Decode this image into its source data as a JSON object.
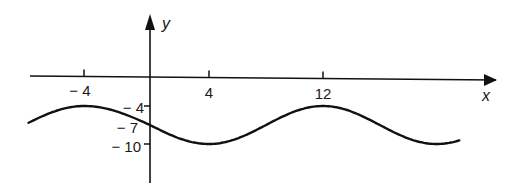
{
  "chart_data": {
    "type": "line",
    "title": "",
    "xlabel": "x",
    "ylabel": "y",
    "x_ticks": [
      -4,
      4,
      12
    ],
    "x_tick_labels": [
      "− 4",
      "4",
      "12"
    ],
    "y_ticks": [
      -4,
      -7,
      -10
    ],
    "y_tick_labels": [
      "− 4",
      "− 7",
      "− 10"
    ],
    "xlim": [
      -8,
      24
    ],
    "ylim": [
      -13,
      3
    ],
    "grid": false,
    "legend": null,
    "function": "y = -7 + 3cos(π(x - 12)/8)",
    "series": [
      {
        "name": "curve",
        "x": [
          -7.5,
          -6,
          -4,
          -2,
          0,
          2,
          4,
          6,
          8,
          10,
          12,
          14,
          16,
          18,
          20,
          21.5
        ],
        "y": [
          -6.4,
          -4.9,
          -4.0,
          -4.9,
          -7.0,
          -9.1,
          -10.0,
          -9.1,
          -7.0,
          -4.9,
          -4.0,
          -4.9,
          -7.0,
          -9.1,
          -10.0,
          -9.6
        ]
      }
    ]
  },
  "pixel_map": {
    "x_ref_values": [
      -8,
      -4,
      0,
      4,
      12,
      22
    ],
    "x_ref_pixels": [
      24,
      84,
      150,
      209,
      323,
      465
    ],
    "y_ref_values": [
      -4,
      -7,
      -10
    ],
    "y_ref_pixels": [
      106,
      125,
      144
    ]
  }
}
